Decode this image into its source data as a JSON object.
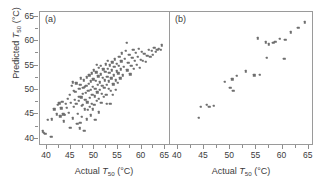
{
  "figure": {
    "axis_labels": {
      "x": "Actual T50 (°C)",
      "y": "Predicted T50 (°C)",
      "x_prefix": "Actual ",
      "x_variable": "T",
      "x_subscript": "50",
      "x_units": " (°C)",
      "y_prefix": "Predicted ",
      "y_variable": "T",
      "y_subscript": "50",
      "y_units": " (°C)"
    },
    "panels": [
      {
        "tag": "(a)"
      },
      {
        "tag": "(b)"
      }
    ],
    "marker_color": "#6e6e6e",
    "frame_color": "#9a9a9a"
  },
  "chart_data": [
    {
      "type": "scatter",
      "title": "(a)",
      "xlabel": "Actual T50 (°C)",
      "ylabel": "Predicted T50 (°C)",
      "xlim": [
        38.5,
        66
      ],
      "ylim": [
        38.5,
        66
      ],
      "xticks": [
        40,
        45,
        50,
        55,
        60,
        65
      ],
      "yticks": [
        40,
        45,
        50,
        55,
        60,
        65
      ],
      "grid": false,
      "legend": null,
      "points": [
        [
          39.1,
          41.5
        ],
        [
          39.3,
          41.2
        ],
        [
          39.6,
          41.0
        ],
        [
          40.9,
          40.4
        ],
        [
          40.2,
          43.9
        ],
        [
          41.0,
          44.0
        ],
        [
          41.5,
          46.0
        ],
        [
          42.0,
          45.0
        ],
        [
          42.3,
          46.9
        ],
        [
          42.6,
          47.3
        ],
        [
          42.8,
          44.6
        ],
        [
          43.0,
          46.2
        ],
        [
          43.2,
          47.6
        ],
        [
          43.4,
          45.0
        ],
        [
          43.6,
          43.6
        ],
        [
          43.8,
          44.9
        ],
        [
          44.0,
          47.1
        ],
        [
          44.2,
          46.3
        ],
        [
          44.4,
          48.2
        ],
        [
          44.6,
          45.3
        ],
        [
          44.8,
          49.0
        ],
        [
          45.0,
          47.4
        ],
        [
          45.2,
          50.8
        ],
        [
          45.4,
          51.6
        ],
        [
          45.5,
          44.2
        ],
        [
          45.7,
          46.5
        ],
        [
          45.9,
          48.0
        ],
        [
          46.0,
          49.6
        ],
        [
          46.2,
          47.2
        ],
        [
          46.4,
          43.0
        ],
        [
          46.5,
          45.1
        ],
        [
          46.7,
          47.8
        ],
        [
          46.8,
          50.2
        ],
        [
          47.0,
          51.0
        ],
        [
          47.1,
          52.4
        ],
        [
          47.2,
          48.5
        ],
        [
          47.3,
          46.8
        ],
        [
          47.4,
          44.5
        ],
        [
          47.5,
          47.0
        ],
        [
          47.6,
          49.2
        ],
        [
          47.7,
          50.5
        ],
        [
          47.8,
          52.0
        ],
        [
          47.9,
          41.6
        ],
        [
          48.0,
          46.0
        ],
        [
          48.1,
          48.0
        ],
        [
          48.2,
          49.4
        ],
        [
          48.3,
          50.9
        ],
        [
          48.4,
          52.6
        ],
        [
          48.5,
          47.5
        ],
        [
          48.6,
          45.9
        ],
        [
          48.7,
          49.8
        ],
        [
          48.8,
          51.3
        ],
        [
          48.9,
          53.0
        ],
        [
          49.0,
          46.6
        ],
        [
          49.1,
          48.4
        ],
        [
          49.2,
          50.0
        ],
        [
          49.3,
          51.8
        ],
        [
          49.4,
          53.4
        ],
        [
          49.5,
          47.2
        ],
        [
          49.6,
          49.0
        ],
        [
          49.7,
          50.6
        ],
        [
          49.8,
          52.2
        ],
        [
          49.9,
          54.0
        ],
        [
          50.0,
          46.9
        ],
        [
          50.1,
          48.7
        ],
        [
          50.2,
          50.3
        ],
        [
          50.3,
          51.9
        ],
        [
          50.4,
          53.6
        ],
        [
          50.5,
          47.8
        ],
        [
          50.6,
          49.5
        ],
        [
          50.7,
          51.1
        ],
        [
          50.8,
          52.8
        ],
        [
          50.9,
          54.5
        ],
        [
          51.0,
          48.2
        ],
        [
          51.1,
          50.0
        ],
        [
          51.2,
          51.6
        ],
        [
          51.3,
          53.2
        ],
        [
          51.4,
          54.9
        ],
        [
          51.5,
          47.4
        ],
        [
          51.6,
          49.2
        ],
        [
          51.7,
          50.8
        ],
        [
          51.8,
          52.5
        ],
        [
          51.9,
          54.2
        ],
        [
          52.0,
          48.6
        ],
        [
          52.1,
          50.4
        ],
        [
          52.2,
          52.0
        ],
        [
          52.3,
          53.7
        ],
        [
          52.4,
          55.3
        ],
        [
          52.5,
          49.0
        ],
        [
          52.6,
          51.0
        ],
        [
          52.7,
          52.7
        ],
        [
          52.8,
          54.4
        ],
        [
          52.9,
          56.0
        ],
        [
          53.0,
          50.2
        ],
        [
          53.1,
          51.8
        ],
        [
          53.2,
          53.5
        ],
        [
          53.3,
          55.1
        ],
        [
          53.4,
          47.1
        ],
        [
          53.5,
          49.8
        ],
        [
          53.6,
          52.4
        ],
        [
          53.7,
          54.0
        ],
        [
          53.8,
          55.7
        ],
        [
          54.0,
          51.2
        ],
        [
          54.1,
          53.0
        ],
        [
          54.2,
          54.7
        ],
        [
          54.3,
          56.3
        ],
        [
          54.5,
          50.0
        ],
        [
          54.6,
          52.0
        ],
        [
          54.7,
          53.8
        ],
        [
          54.8,
          55.4
        ],
        [
          55.0,
          51.5
        ],
        [
          55.1,
          53.4
        ],
        [
          55.2,
          55.0
        ],
        [
          55.3,
          56.8
        ],
        [
          55.5,
          52.4
        ],
        [
          55.6,
          54.2
        ],
        [
          55.7,
          55.9
        ],
        [
          55.8,
          57.5
        ],
        [
          56.0,
          53.0
        ],
        [
          56.2,
          54.8
        ],
        [
          56.4,
          56.4
        ],
        [
          56.6,
          58.0
        ],
        [
          56.8,
          59.7
        ],
        [
          57.0,
          54.0
        ],
        [
          57.2,
          55.6
        ],
        [
          57.4,
          57.2
        ],
        [
          57.6,
          53.2
        ],
        [
          57.8,
          55.0
        ],
        [
          58.0,
          56.6
        ],
        [
          58.2,
          58.2
        ],
        [
          58.4,
          54.4
        ],
        [
          58.6,
          56.0
        ],
        [
          58.8,
          57.6
        ],
        [
          59.0,
          55.2
        ],
        [
          59.2,
          56.8
        ],
        [
          59.4,
          58.4
        ],
        [
          59.6,
          54.6
        ],
        [
          59.8,
          56.2
        ],
        [
          60.0,
          57.8
        ],
        [
          60.3,
          56.0
        ],
        [
          60.6,
          57.4
        ],
        [
          60.9,
          55.8
        ],
        [
          61.2,
          57.0
        ],
        [
          61.5,
          58.3
        ],
        [
          61.8,
          56.8
        ],
        [
          62.1,
          58.0
        ],
        [
          62.4,
          57.2
        ],
        [
          62.7,
          58.6
        ],
        [
          63.0,
          57.8
        ],
        [
          63.3,
          58.2
        ],
        [
          63.6,
          58.4
        ],
        [
          64.0,
          58.3
        ],
        [
          64.3,
          59.2
        ],
        [
          44.9,
          42.2
        ],
        [
          46.9,
          42.1
        ],
        [
          49.3,
          44.8
        ],
        [
          50.2,
          43.9
        ],
        [
          52.6,
          47.1
        ],
        [
          45.6,
          49.8
        ],
        [
          46.2,
          51.4
        ],
        [
          47.0,
          43.2
        ],
        [
          48.4,
          44.0
        ],
        [
          51.0,
          45.4
        ],
        [
          53.9,
          49.0
        ],
        [
          50.5,
          55.2
        ],
        [
          49.7,
          46.0
        ],
        [
          48.0,
          50.6
        ],
        [
          46.8,
          48.6
        ]
      ]
    },
    {
      "type": "scatter",
      "title": "(b)",
      "xlabel": "Actual T50 (°C)",
      "ylabel": "Predicted T50 (°C)",
      "xlim": [
        38.5,
        66
      ],
      "ylim": [
        38.5,
        66
      ],
      "xticks": [
        40,
        45,
        50,
        55,
        60,
        65
      ],
      "yticks": [
        40,
        45,
        50,
        55,
        60,
        65
      ],
      "grid": false,
      "legend": null,
      "points": [
        [
          44.0,
          44.3
        ],
        [
          44.4,
          46.6
        ],
        [
          45.5,
          47.0
        ],
        [
          46.0,
          46.6
        ],
        [
          46.9,
          46.7
        ],
        [
          49.0,
          51.7
        ],
        [
          50.0,
          50.5
        ],
        [
          50.4,
          52.2
        ],
        [
          50.6,
          49.8
        ],
        [
          51.3,
          52.9
        ],
        [
          53.0,
          53.8
        ],
        [
          54.6,
          53.0
        ],
        [
          55.3,
          60.6
        ],
        [
          55.6,
          53.1
        ],
        [
          56.8,
          59.8
        ],
        [
          57.0,
          56.6
        ],
        [
          57.4,
          59.4
        ],
        [
          58.2,
          59.7
        ],
        [
          58.6,
          59.9
        ],
        [
          59.5,
          60.5
        ],
        [
          60.3,
          56.4
        ],
        [
          60.5,
          60.3
        ],
        [
          61.6,
          61.8
        ],
        [
          63.0,
          62.8
        ],
        [
          64.2,
          63.9
        ]
      ]
    }
  ]
}
